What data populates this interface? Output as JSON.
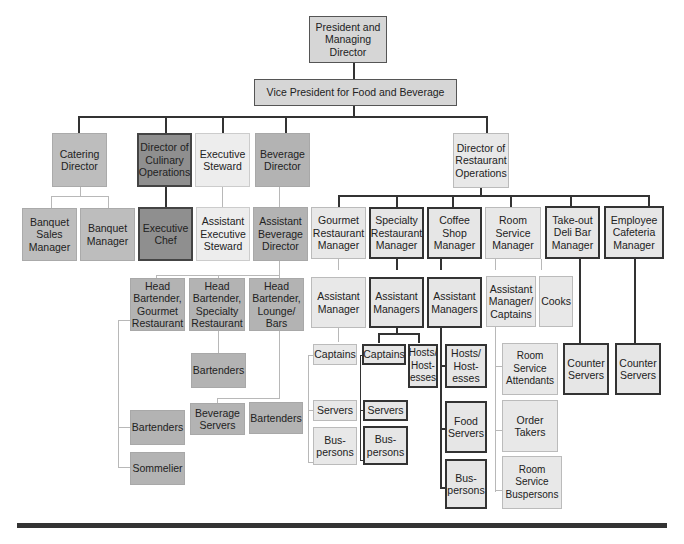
{
  "chart": {
    "top": {
      "label": "President and Managing Director"
    },
    "vp": {
      "label": "Vice President for Food and Beverage"
    },
    "catering": {
      "director": "Catering Director",
      "reports": [
        "Banquet Sales Manager",
        "Banquet Manager"
      ]
    },
    "culinary": {
      "director": "Director of Culinary Operations",
      "reports": [
        "Executive Chef"
      ]
    },
    "steward": {
      "director": "Executive Steward",
      "reports": [
        "Assistant Executive Steward"
      ]
    },
    "beverage": {
      "director": "Beverage Director",
      "assistant": "Assistant Beverage Director",
      "head_bartenders": [
        {
          "label": "Head Bartender, Gourmet Restaurant",
          "reports": [
            "Bartenders",
            "Sommelier"
          ]
        },
        {
          "label": "Head Bartender, Specialty Restaurant",
          "reports": [
            "Bartenders"
          ]
        },
        {
          "label": "Head Bartender, Lounge/ Bars",
          "reports": [
            "Beverage Servers",
            "Bartenders"
          ]
        }
      ]
    },
    "restaurant_ops": {
      "director": "Director of Restaurant Operations",
      "units": [
        {
          "manager": "Gourmet Restaurant Manager",
          "assistant": "Assistant Manager",
          "staff": [
            "Captains",
            "Servers",
            "Bus-persons"
          ]
        },
        {
          "manager": "Specialty Restaurant Manager",
          "assistant": "Assistant Managers",
          "staff": [
            "Captains",
            "Hosts/ Host-esses",
            "Servers",
            "Bus-persons"
          ]
        },
        {
          "manager": "Coffee Shop Manager",
          "assistant": "Assistant Managers",
          "staff": [
            "Hosts/ Host-esses",
            "Food Servers",
            "Bus-persons"
          ]
        },
        {
          "manager": "Room Service Manager",
          "assistant": "Assistant Manager/ Captains",
          "cooks": "Cooks",
          "staff": [
            "Room Service Attendants",
            "Order Takers",
            "Room Service Buspersons"
          ]
        },
        {
          "manager": "Take-out Deli Bar Manager",
          "staff": [
            "Counter Servers"
          ]
        },
        {
          "manager": "Employee Cafeteria Manager",
          "staff": [
            "Counter Servers"
          ]
        }
      ]
    }
  }
}
